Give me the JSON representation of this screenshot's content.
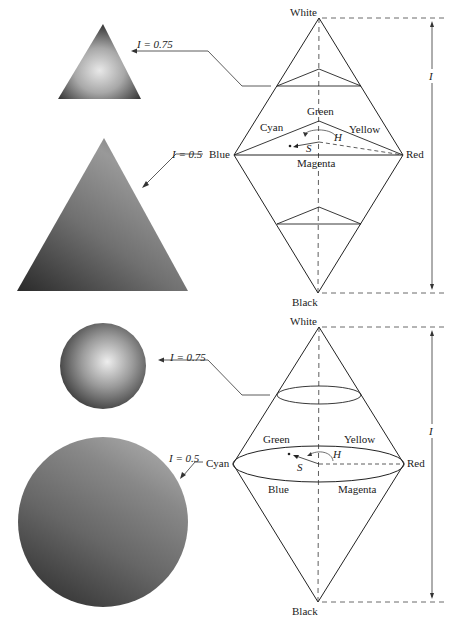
{
  "top_model": {
    "name": "HSI triangle/double-pyramid model",
    "vertices": {
      "top": "White",
      "bottom": "Black",
      "left": "Blue",
      "right": "Red"
    },
    "hue_labels": {
      "top": "Green",
      "left_upper": "Cyan",
      "right_upper": "Yellow",
      "bottom": "Magenta"
    },
    "angle_label": "H",
    "saturation_label": "S",
    "intensity_axis_label": "I",
    "callouts": [
      {
        "label": "I = 0.75"
      },
      {
        "label": "I = 0.5"
      }
    ]
  },
  "bottom_model": {
    "name": "HSI circular/double-cone model",
    "vertices": {
      "top": "White",
      "bottom": "Black",
      "left": "Cyan",
      "right": "Red"
    },
    "hue_labels": {
      "upper_left": "Green",
      "upper_right": "Yellow",
      "lower_left": "Blue",
      "lower_right": "Magenta"
    },
    "angle_label": "H",
    "saturation_label": "S",
    "intensity_axis_label": "I",
    "callouts": [
      {
        "label": "I = 0.75"
      },
      {
        "label": "I = 0.5"
      }
    ]
  }
}
